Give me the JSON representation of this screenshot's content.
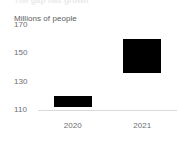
{
  "clipped_header_text": "The gap has grown",
  "chart_data": {
    "type": "bar",
    "title": "",
    "subtitle": "",
    "axis_unit_label": "Millions of people",
    "xlabel": "",
    "ylabel": "Millions of people",
    "categories": [
      "2020",
      "2021"
    ],
    "bar_style": "floating-range",
    "ylim": [
      110,
      170
    ],
    "yticks": [
      110,
      130,
      150,
      170
    ],
    "ytick_labels": [
      "110",
      "130",
      "150",
      "170"
    ],
    "grid": false,
    "legend": false,
    "legend_position": "none",
    "series": [
      {
        "name": "Range",
        "low": [
          112,
          136
        ],
        "high": [
          120,
          160
        ],
        "values": [
          8,
          24
        ]
      }
    ],
    "bars": [
      {
        "category": "2020",
        "bottom": 112,
        "top": 120,
        "color": "#000000"
      },
      {
        "category": "2021",
        "bottom": 136,
        "top": 160,
        "color": "#000000"
      }
    ],
    "colors": {
      "bar": "#000000",
      "axis_line": "#d8d9da",
      "tick_text": "#6d6e71",
      "label_text": "#5b5c5e",
      "background": "#ffffff"
    }
  }
}
